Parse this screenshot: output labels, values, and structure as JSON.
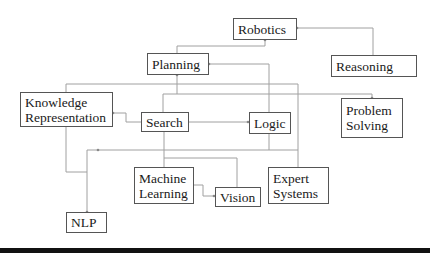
{
  "diagram": {
    "type": "concept-map",
    "nodes": {
      "robotics": {
        "lines": [
          "Robotics"
        ]
      },
      "reasoning": {
        "lines": [
          "Reasoning"
        ]
      },
      "planning": {
        "lines": [
          "Planning"
        ]
      },
      "knowledge_representation": {
        "lines": [
          "Knowledge",
          "Representation"
        ]
      },
      "search": {
        "lines": [
          "Search"
        ]
      },
      "logic": {
        "lines": [
          "Logic"
        ]
      },
      "problem_solving": {
        "lines": [
          "Problem",
          "Solving"
        ]
      },
      "machine_learning": {
        "lines": [
          "Machine",
          "Learning"
        ]
      },
      "vision": {
        "lines": [
          "Vision"
        ]
      },
      "expert_systems": {
        "lines": [
          "Expert",
          "Systems"
        ]
      },
      "nlp": {
        "lines": [
          "NLP"
        ]
      }
    },
    "edges": [
      {
        "from": "Reasoning",
        "to": "Robotics"
      },
      {
        "from": "Planning",
        "to": "Robotics"
      },
      {
        "from": "Logic",
        "to": "Planning"
      },
      {
        "from": "Search",
        "to": "Planning"
      },
      {
        "from": "Search",
        "to": "Knowledge Representation"
      },
      {
        "from": "Search",
        "to": "Logic"
      },
      {
        "from": "Search",
        "to": "Problem Solving"
      },
      {
        "from": "Knowledge Representation",
        "to": "Expert Systems"
      },
      {
        "from": "Knowledge Representation",
        "to": "NLP"
      },
      {
        "from": "Logic",
        "to": "NLP"
      },
      {
        "from": "Search",
        "to": "Machine Learning"
      },
      {
        "from": "Search",
        "to": "Vision"
      },
      {
        "from": "Machine Learning",
        "to": "Vision"
      }
    ],
    "line_color": "#9a9a9a",
    "border_color": "#555555"
  }
}
